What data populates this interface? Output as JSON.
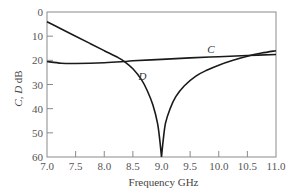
{
  "chart_data": {
    "type": "line",
    "title": "",
    "xlabel": "Frequency GHz",
    "ylabel": "C, D dB",
    "xlim": [
      7.0,
      11.0
    ],
    "ylim": [
      0,
      60
    ],
    "y_inverted": true,
    "grid": false,
    "legend": "inline labels",
    "x_ticks": [
      "7.0",
      "7.5",
      "8.0",
      "8.5",
      "9.0",
      "9.5",
      "10.0",
      "10.5",
      "11.0"
    ],
    "y_ticks": [
      "0",
      "10",
      "20",
      "30",
      "40",
      "50",
      "60"
    ],
    "series": [
      {
        "name": "C",
        "label_position": {
          "x": 9.8,
          "y": 17
        },
        "x": [
          7.0,
          7.25,
          7.5,
          8.0,
          8.35,
          8.5,
          9.0,
          9.5,
          10.0,
          10.5,
          11.0
        ],
        "values": [
          20.5,
          21.2,
          21.3,
          21.0,
          20.5,
          20.2,
          19.6,
          19.0,
          18.5,
          18.0,
          17.6
        ]
      },
      {
        "name": "D",
        "label_position": {
          "x": 8.6,
          "y": 28
        },
        "x": [
          7.0,
          7.25,
          7.5,
          7.75,
          8.0,
          8.25,
          8.35,
          8.5,
          8.65,
          8.75,
          8.85,
          8.93,
          8.97,
          9.0,
          9.03,
          9.07,
          9.15,
          9.25,
          9.4,
          9.6,
          9.8,
          10.0,
          10.25,
          10.5,
          10.75,
          11.0
        ],
        "values": [
          4.0,
          7.0,
          10.0,
          13.0,
          16.0,
          19.0,
          20.5,
          23.5,
          28.0,
          32.5,
          38.5,
          46.0,
          53.0,
          60.0,
          53.0,
          46.0,
          40.0,
          35.0,
          30.5,
          26.5,
          24.0,
          22.0,
          20.0,
          18.3,
          17.0,
          16.0
        ]
      }
    ]
  },
  "colors": {
    "axis": "#8a8a8a",
    "curve": "#1a1a1a",
    "text": "#555555"
  }
}
